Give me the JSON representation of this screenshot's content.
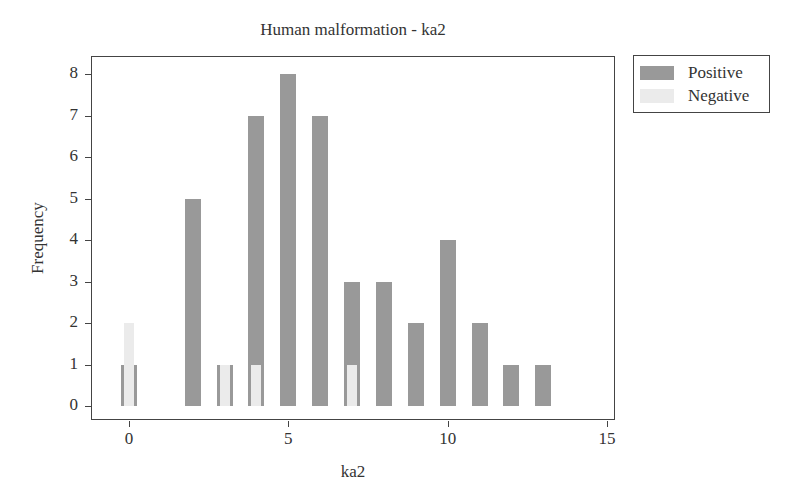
{
  "chart_data": {
    "type": "bar",
    "title": "Human malformation - ka2",
    "xlabel": "ka2",
    "ylabel": "Frequency",
    "xlim": [
      -1.2,
      15.3
    ],
    "ylim": [
      -0.35,
      8.4
    ],
    "xticks": [
      0,
      5,
      10,
      15
    ],
    "yticks": [
      0,
      1,
      2,
      3,
      4,
      5,
      6,
      7,
      8
    ],
    "grid": false,
    "legend_position": "right-outside-top",
    "overlay": true,
    "x": [
      0,
      2,
      3,
      4,
      5,
      6,
      7,
      8,
      9,
      10,
      11,
      12,
      13
    ],
    "series": [
      {
        "name": "Positive",
        "color": "#999999",
        "x": [
          0,
          2,
          3,
          4,
          5,
          6,
          7,
          8,
          9,
          10,
          11,
          12,
          13
        ],
        "values": [
          1,
          5,
          1,
          7,
          8,
          7,
          3,
          3,
          2,
          4,
          2,
          1,
          1
        ]
      },
      {
        "name": "Negative",
        "color": "#ebebeb",
        "x": [
          0,
          3,
          4,
          7
        ],
        "values": [
          2,
          1,
          1,
          1
        ]
      }
    ]
  },
  "legend": {
    "items": [
      {
        "label": "Positive",
        "color": "#999999"
      },
      {
        "label": "Negative",
        "color": "#ebebeb"
      }
    ]
  },
  "axes": {
    "x_tick_labels": [
      "0",
      "5",
      "10",
      "15"
    ],
    "y_tick_labels": [
      "0",
      "1",
      "2",
      "3",
      "4",
      "5",
      "6",
      "7",
      "8"
    ]
  }
}
